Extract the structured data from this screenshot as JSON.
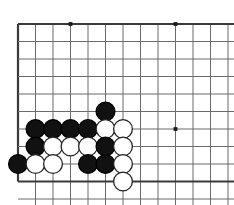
{
  "figure": {
    "kind": "go-board-diagram",
    "width": 234,
    "height": 205,
    "background_color": "#ffffff"
  },
  "board": {
    "origin_x": 18,
    "origin_y": 24,
    "cell": 17.5,
    "cols": 12,
    "rows": 10,
    "edge_top_row": 0,
    "edge_left_col": 0,
    "edge_bottom_row": 9,
    "line_color": "#6b6b6b",
    "edge_line_color": "#3a3a3a",
    "line_width": 1,
    "edge_line_width": 2.2,
    "stone_radius": 9.4,
    "star_point_radius": 1.9,
    "star_point_color": "#1a1a1a",
    "star_points": [
      {
        "col": 3,
        "row": 0
      },
      {
        "col": 9,
        "row": 0
      },
      {
        "col": 9,
        "row": 6
      }
    ]
  },
  "stones": {
    "black_color": "#111111",
    "white_color": "#ffffff",
    "white_outline_color": "#222222",
    "black_outline_color": "#000000",
    "outline_width": 1.3,
    "list": [
      {
        "color": "black",
        "col": 5,
        "row": 5,
        "label": "black-stone-c5-r5"
      },
      {
        "color": "black",
        "col": 1,
        "row": 6,
        "label": "black-stone-c1-r6"
      },
      {
        "color": "black",
        "col": 2,
        "row": 6,
        "label": "black-stone-c2-r6"
      },
      {
        "color": "black",
        "col": 3,
        "row": 6,
        "label": "black-stone-c3-r6"
      },
      {
        "color": "black",
        "col": 4,
        "row": 6,
        "label": "black-stone-c4-r6"
      },
      {
        "color": "white",
        "col": 5,
        "row": 6,
        "label": "white-stone-c5-r6"
      },
      {
        "color": "white",
        "col": 6,
        "row": 6,
        "label": "white-stone-c6-r6"
      },
      {
        "color": "black",
        "col": 1,
        "row": 7,
        "label": "black-stone-c1-r7"
      },
      {
        "color": "white",
        "col": 2,
        "row": 7,
        "label": "white-stone-c2-r7"
      },
      {
        "color": "white",
        "col": 3,
        "row": 7,
        "label": "white-stone-c3-r7"
      },
      {
        "color": "white",
        "col": 4,
        "row": 7,
        "label": "white-stone-c4-r7"
      },
      {
        "color": "black",
        "col": 5,
        "row": 7,
        "label": "black-stone-c5-r7"
      },
      {
        "color": "white",
        "col": 6,
        "row": 7,
        "label": "white-stone-c6-r7"
      },
      {
        "color": "black",
        "col": 0,
        "row": 8,
        "label": "black-stone-c0-r8"
      },
      {
        "color": "white",
        "col": 1,
        "row": 8,
        "label": "white-stone-c1-r8"
      },
      {
        "color": "white",
        "col": 2,
        "row": 8,
        "label": "white-stone-c2-r8"
      },
      {
        "color": "black",
        "col": 4,
        "row": 8,
        "label": "black-stone-c4-r8"
      },
      {
        "color": "black",
        "col": 5,
        "row": 8,
        "label": "black-stone-c5-r8"
      },
      {
        "color": "white",
        "col": 6,
        "row": 8,
        "label": "white-stone-c6-r8"
      },
      {
        "color": "white",
        "col": 6,
        "row": 9,
        "label": "white-stone-c6-r9"
      }
    ]
  }
}
